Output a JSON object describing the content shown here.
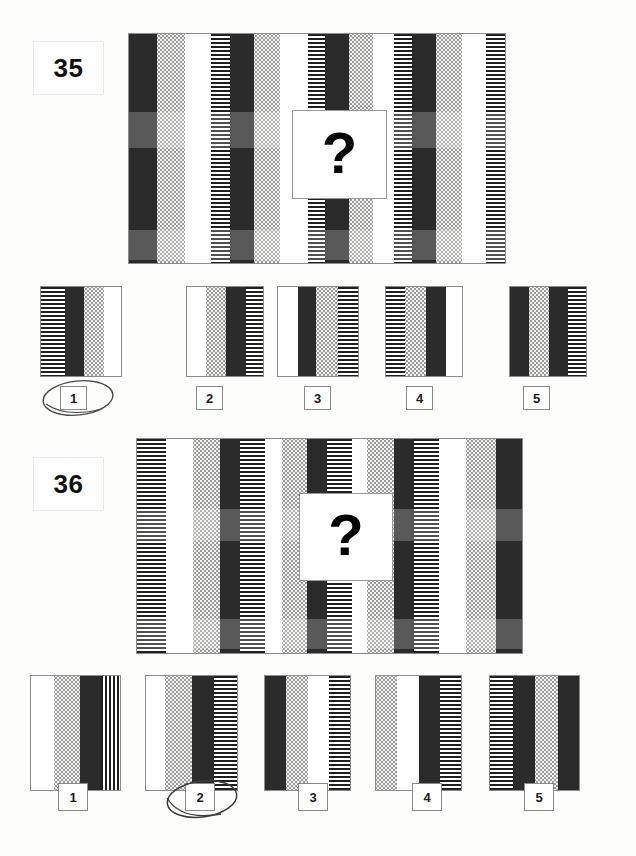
{
  "page": {
    "background_color": "#fdfdfc",
    "ink_color": "#2b2b2b",
    "marking_color": "#4a4a4a"
  },
  "legend": {
    "fills": {
      "black": "solid black bar",
      "white": "plain white bar",
      "dot": "light stippled / dotted bar",
      "hline": "horizontal hatched bar",
      "vline": "vertical hatched bar"
    }
  },
  "items": [
    {
      "number": "35",
      "question_mark": "?",
      "stimulus": {
        "sequence_period": 4,
        "pattern": [
          "black",
          "dot",
          "white",
          "hline"
        ],
        "stripes": [
          "black",
          "dot",
          "white",
          "hline",
          "black",
          "dot",
          "white",
          "hline",
          "black",
          "dot",
          "white",
          "hline",
          "black",
          "dot",
          "white",
          "hline"
        ]
      },
      "options": [
        {
          "label": "1",
          "stripes": [
            "hline",
            "black",
            "dot",
            "white"
          ],
          "selected": true
        },
        {
          "label": "2",
          "stripes": [
            "white",
            "dot",
            "black",
            "hline"
          ],
          "selected": false
        },
        {
          "label": "3",
          "stripes": [
            "white",
            "black",
            "dot",
            "hline"
          ],
          "selected": false
        },
        {
          "label": "4",
          "stripes": [
            "hline",
            "dot",
            "black",
            "white"
          ],
          "selected": false
        },
        {
          "label": "5",
          "stripes": [
            "black",
            "dot",
            "black",
            "hline"
          ],
          "selected": false
        }
      ],
      "marked_answer": "1"
    },
    {
      "number": "36",
      "question_mark": "?",
      "stimulus": {
        "sequence_period": 4,
        "pattern": [
          "hline",
          "white",
          "dot",
          "black"
        ],
        "stripes": [
          "hline",
          "white",
          "dot",
          "black",
          "hline",
          "white",
          "dot",
          "black",
          "hline",
          "white",
          "dot",
          "black",
          "hline",
          "white",
          "dot",
          "black"
        ]
      },
      "options": [
        {
          "label": "1",
          "stripes": [
            "white",
            "dot",
            "black",
            "vline"
          ],
          "selected": false
        },
        {
          "label": "2",
          "stripes": [
            "white",
            "dot",
            "black",
            "hline"
          ],
          "selected": true
        },
        {
          "label": "3",
          "stripes": [
            "black",
            "dot",
            "white",
            "hline"
          ],
          "selected": false
        },
        {
          "label": "4",
          "stripes": [
            "dot",
            "white",
            "black",
            "hline"
          ],
          "selected": false
        },
        {
          "label": "5",
          "stripes": [
            "hline",
            "black",
            "dot",
            "black"
          ],
          "selected": false
        }
      ],
      "marked_answer": "2"
    }
  ]
}
